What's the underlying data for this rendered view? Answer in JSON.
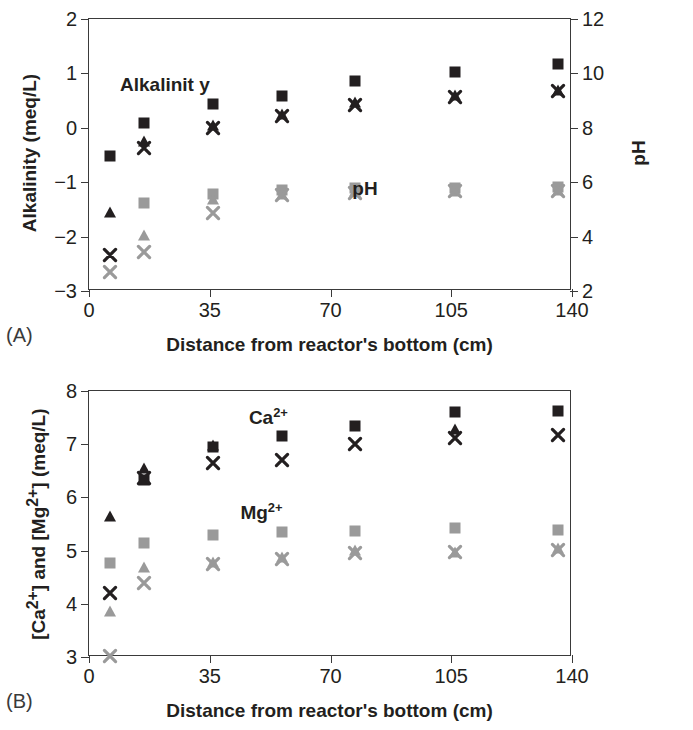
{
  "figure": {
    "panel_a_letter": "(A)",
    "panel_b_letter": "(B)"
  },
  "colors": {
    "dark": "#231f20",
    "light": "#9a9a9a",
    "axis": "#3a3a3a"
  },
  "chart_data": [
    {
      "type": "scatter",
      "panel": "A",
      "title": "",
      "xlabel": "Distance from reactor's bottom (cm)",
      "ylabel": "Alkalinity (meq/L)",
      "y2label": "pH",
      "xlim": [
        0,
        140
      ],
      "ylim": [
        -3,
        2
      ],
      "y2lim": [
        2,
        12
      ],
      "xticks": [
        0,
        35,
        70,
        105,
        140
      ],
      "yticks": [
        -3,
        -2,
        -1,
        0,
        1,
        2
      ],
      "y2ticks": [
        2,
        4,
        6,
        8,
        10,
        12
      ],
      "grid": false,
      "legend_position": "in-plot-annotation",
      "annotations": [
        {
          "text": "Alkalinit y",
          "x": 22,
          "y": 0.78
        },
        {
          "text": "pH",
          "x": 80,
          "y": -1.12
        }
      ],
      "x": [
        6,
        16,
        36,
        56,
        77,
        106,
        136
      ],
      "series": [
        {
          "name": "Alkalinity run 1",
          "marker": "square",
          "color": "dark",
          "axis": "left",
          "values": [
            -0.52,
            0.09,
            0.44,
            0.58,
            0.86,
            1.03,
            1.18
          ]
        },
        {
          "name": "Alkalinity run 2",
          "marker": "triangle",
          "color": "dark",
          "axis": "left",
          "values": [
            -1.55,
            -0.25,
            0.05,
            0.26,
            0.47,
            0.6,
            0.7
          ]
        },
        {
          "name": "Alkalinity run 3",
          "marker": "x",
          "color": "dark",
          "axis": "left",
          "values": [
            -2.33,
            -0.38,
            -0.01,
            0.21,
            0.42,
            0.57,
            0.68
          ]
        },
        {
          "name": "pH run 1",
          "marker": "square",
          "color": "light",
          "axis": "right",
          "values": [
            null,
            5.25,
            5.55,
            5.72,
            5.78,
            5.8,
            5.82
          ]
        },
        {
          "name": "pH run 2",
          "marker": "triangle",
          "color": "light",
          "axis": "right",
          "values": [
            null,
            4.05,
            5.4,
            5.58,
            5.66,
            5.68,
            5.7
          ]
        },
        {
          "name": "pH run 3",
          "marker": "x",
          "color": "light",
          "axis": "right",
          "values": [
            2.7,
            3.42,
            4.88,
            5.52,
            5.62,
            5.66,
            5.68
          ]
        }
      ]
    },
    {
      "type": "scatter",
      "panel": "B",
      "title": "",
      "xlabel": "Distance from reactor's bottom (cm)",
      "ylabel": "[Ca2+] and [Mg2+] (meq/L)",
      "xlim": [
        0,
        140
      ],
      "ylim": [
        3,
        8
      ],
      "xticks": [
        0,
        35,
        70,
        105,
        140
      ],
      "yticks": [
        3,
        4,
        5,
        6,
        7,
        8
      ],
      "grid": false,
      "legend_position": "in-plot-annotation",
      "annotations": [
        {
          "text": "Ca2+",
          "x": 52,
          "y": 7.52
        },
        {
          "text": "Mg2+",
          "x": 50,
          "y": 5.72
        }
      ],
      "x": [
        6,
        16,
        36,
        56,
        77,
        106,
        136
      ],
      "series": [
        {
          "name": "Ca run 1",
          "marker": "square",
          "color": "dark",
          "values": [
            null,
            6.33,
            6.94,
            7.15,
            7.35,
            7.6,
            7.63
          ]
        },
        {
          "name": "Ca run 2",
          "marker": "triangle",
          "color": "dark",
          "values": [
            5.65,
            6.55,
            6.98,
            null,
            null,
            7.28,
            null
          ]
        },
        {
          "name": "Ca run 3",
          "marker": "x",
          "color": "dark",
          "values": [
            4.2,
            6.36,
            6.64,
            6.7,
            7.0,
            7.12,
            7.18
          ]
        },
        {
          "name": "Mg run 1",
          "marker": "square",
          "color": "light",
          "values": [
            4.76,
            5.14,
            5.3,
            5.35,
            5.36,
            5.43,
            5.38
          ]
        },
        {
          "name": "Mg run 2",
          "marker": "triangle",
          "color": "light",
          "values": [
            3.86,
            4.7,
            4.78,
            4.88,
            5.02,
            4.98,
            5.05
          ]
        },
        {
          "name": "Mg run 3",
          "marker": "x",
          "color": "light",
          "values": [
            3.02,
            4.4,
            4.74,
            4.84,
            4.96,
            4.97,
            5.02
          ]
        }
      ]
    }
  ]
}
